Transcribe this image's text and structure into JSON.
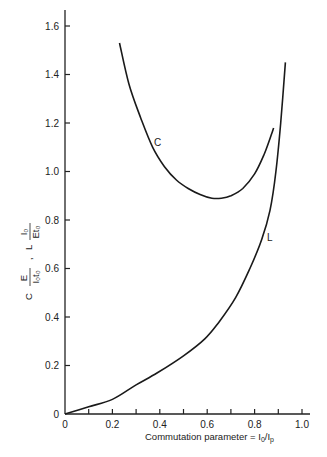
{
  "chart_data": {
    "type": "line",
    "title": "",
    "xlabel": "Commutation parameter = I0/Ip",
    "ylabel": "C·E/(I0·t0) , L·I0/(E·t0)",
    "xlim": [
      0,
      1.0
    ],
    "ylim": [
      0,
      1.6
    ],
    "x_ticks": [
      "0",
      "0.2",
      "0.4",
      "0.6",
      "0.8",
      "1.0"
    ],
    "x_minor_ticks": [
      0.1,
      0.2,
      0.3,
      0.4,
      0.5,
      0.6,
      0.7,
      0.8,
      0.9,
      1.0
    ],
    "y_ticks": [
      "0",
      "0.2",
      "0.4",
      "0.6",
      "0.8",
      "1.0",
      "1.2",
      "1.4",
      "1.6"
    ],
    "grid": false,
    "legend": "none (curves labeled inline)",
    "series": [
      {
        "name": "C",
        "label": "C",
        "x": [
          0.23,
          0.27,
          0.32,
          0.37,
          0.42,
          0.47,
          0.52,
          0.57,
          0.62,
          0.66,
          0.7,
          0.75,
          0.8,
          0.84,
          0.87,
          0.88
        ],
        "y": [
          1.53,
          1.36,
          1.22,
          1.1,
          1.02,
          0.965,
          0.93,
          0.905,
          0.89,
          0.89,
          0.9,
          0.93,
          0.99,
          1.07,
          1.15,
          1.18
        ]
      },
      {
        "name": "L",
        "label": "L",
        "x": [
          0.0,
          0.1,
          0.2,
          0.3,
          0.39,
          0.5,
          0.59,
          0.65,
          0.72,
          0.78,
          0.83,
          0.865,
          0.89,
          0.91,
          0.93
        ],
        "y": [
          0.0,
          0.03,
          0.06,
          0.12,
          0.17,
          0.24,
          0.31,
          0.38,
          0.48,
          0.6,
          0.72,
          0.84,
          1.0,
          1.2,
          1.45
        ]
      }
    ]
  },
  "axis": {
    "x_title_main": "Commutation parameter = I",
    "x_title_sub0": "0",
    "x_title_slash": "/I",
    "x_title_subp": "p",
    "y_title_c": "C",
    "y_title_c_num": "E",
    "y_title_c_den": "I₀t₀",
    "y_title_sep": ",",
    "y_title_l": "L",
    "y_title_l_num": "I₀",
    "y_title_l_den": "Et₀"
  },
  "labels": {
    "curve_c": "C",
    "curve_l": "L"
  }
}
